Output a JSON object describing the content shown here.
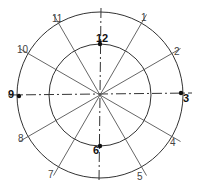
{
  "diagram": {
    "center": [
      100,
      95
    ],
    "outer_radius": 83,
    "inner_radius": 51,
    "line_color": "#333333",
    "hour_labels": [
      {
        "text": "12",
        "x": 96,
        "y": 42,
        "bold": true
      },
      {
        "text": "1",
        "x": 141,
        "y": 21,
        "bold": false
      },
      {
        "text": "2",
        "x": 174,
        "y": 55,
        "bold": false
      },
      {
        "text": "3",
        "x": 183,
        "y": 102,
        "bold": true
      },
      {
        "text": "4",
        "x": 170,
        "y": 146,
        "bold": false
      },
      {
        "text": "5",
        "x": 137,
        "y": 180,
        "bold": false
      },
      {
        "text": "6",
        "x": 93,
        "y": 154,
        "bold": true
      },
      {
        "text": "7",
        "x": 48,
        "y": 178,
        "bold": false
      },
      {
        "text": "8",
        "x": 18,
        "y": 142,
        "bold": false
      },
      {
        "text": "9",
        "x": 8,
        "y": 98,
        "bold": true
      },
      {
        "text": "10",
        "x": 17,
        "y": 53,
        "bold": false
      },
      {
        "text": "11",
        "x": 52,
        "y": 22,
        "bold": false
      }
    ]
  }
}
